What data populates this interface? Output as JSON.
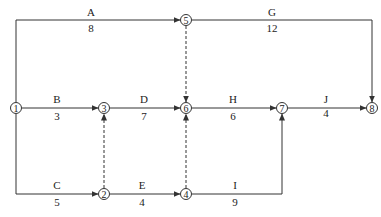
{
  "diagram": {
    "type": "activity-on-arrow network diagram",
    "nodes": [
      {
        "id": "1",
        "x": 16,
        "y": 108
      },
      {
        "id": "2",
        "x": 104,
        "y": 194
      },
      {
        "id": "3",
        "x": 104,
        "y": 108
      },
      {
        "id": "4",
        "x": 186,
        "y": 194
      },
      {
        "id": "5",
        "x": 186,
        "y": 20
      },
      {
        "id": "6",
        "x": 186,
        "y": 108
      },
      {
        "id": "7",
        "x": 282,
        "y": 108
      },
      {
        "id": "8",
        "x": 372,
        "y": 108
      }
    ],
    "activities": [
      {
        "name": "A",
        "duration": "8",
        "from": "1",
        "to": "5"
      },
      {
        "name": "B",
        "duration": "3",
        "from": "1",
        "to": "3"
      },
      {
        "name": "C",
        "duration": "5",
        "from": "1",
        "to": "2"
      },
      {
        "name": "D",
        "duration": "7",
        "from": "3",
        "to": "6"
      },
      {
        "name": "E",
        "duration": "4",
        "from": "2",
        "to": "4"
      },
      {
        "name": "G",
        "duration": "12",
        "from": "5",
        "to": "8"
      },
      {
        "name": "H",
        "duration": "6",
        "from": "6",
        "to": "7"
      },
      {
        "name": "I",
        "duration": "9",
        "from": "4",
        "to": "7"
      },
      {
        "name": "J",
        "duration": "4",
        "from": "7",
        "to": "8"
      }
    ],
    "dummies": [
      {
        "from": "5",
        "to": "6"
      },
      {
        "from": "2",
        "to": "3"
      },
      {
        "from": "4",
        "to": "6"
      }
    ]
  },
  "labels": {
    "A": {
      "name": "A",
      "duration": "8"
    },
    "B": {
      "name": "B",
      "duration": "3"
    },
    "C": {
      "name": "C",
      "duration": "5"
    },
    "D": {
      "name": "D",
      "duration": "7"
    },
    "E": {
      "name": "E",
      "duration": "4"
    },
    "G": {
      "name": "G",
      "duration": "12"
    },
    "H": {
      "name": "H",
      "duration": "6"
    },
    "I": {
      "name": "I",
      "duration": "9"
    },
    "J": {
      "name": "J",
      "duration": "4"
    }
  },
  "node_labels": {
    "n1": "1",
    "n2": "2",
    "n3": "3",
    "n4": "4",
    "n5": "5",
    "n6": "6",
    "n7": "7",
    "n8": "8"
  },
  "colors": {
    "line": "#333333",
    "background": "#ffffff"
  }
}
